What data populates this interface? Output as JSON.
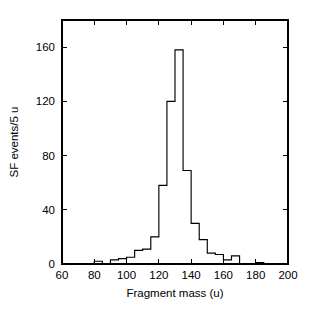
{
  "chart_data": {
    "type": "bar",
    "title": "",
    "subtitle": "",
    "xlabel": "Fragment mass (u)",
    "ylabel": "SF events/5 u",
    "xlim": [
      60,
      200
    ],
    "ylim": [
      0,
      180
    ],
    "xticks": [
      60,
      80,
      100,
      120,
      140,
      160,
      180,
      200
    ],
    "xtick_labels": [
      "60",
      "80",
      "100",
      "120",
      "140",
      "160",
      "180",
      "200"
    ],
    "yticks": [
      0,
      40,
      80,
      120,
      160
    ],
    "ytick_labels": [
      "0",
      "40",
      "80",
      "120",
      "160"
    ],
    "grid": false,
    "legend": null,
    "bin_width": 5,
    "bin_edges": [
      60,
      65,
      70,
      75,
      80,
      85,
      90,
      95,
      100,
      105,
      110,
      115,
      120,
      125,
      130,
      135,
      140,
      145,
      150,
      155,
      160,
      165,
      170,
      175,
      180,
      185,
      190,
      195,
      200
    ],
    "categories": [
      "60-65",
      "65-70",
      "70-75",
      "75-80",
      "80-85",
      "85-90",
      "90-95",
      "95-100",
      "100-105",
      "105-110",
      "110-115",
      "115-120",
      "120-125",
      "125-130",
      "130-135",
      "135-140",
      "140-145",
      "145-150",
      "150-155",
      "155-160",
      "160-165",
      "165-170",
      "170-175",
      "175-180",
      "180-185",
      "185-190",
      "190-195",
      "195-200"
    ],
    "values": [
      0,
      0,
      0,
      0,
      2,
      0,
      3,
      4,
      5,
      10,
      11,
      20,
      58,
      120,
      158,
      69,
      30,
      18,
      8,
      7,
      3,
      6,
      0,
      0,
      1,
      0,
      0,
      0
    ],
    "line_color": "#000000",
    "background_color": "#ffffff",
    "annotations": []
  },
  "axes": {
    "x_axis_name": "fragment-mass-axis",
    "y_axis_name": "sf-events-axis"
  }
}
